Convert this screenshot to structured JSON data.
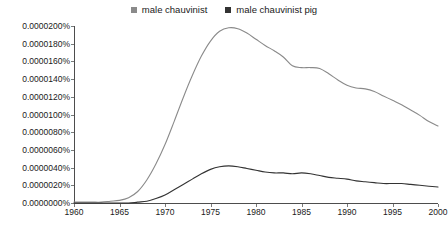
{
  "legend": {
    "position": "top-center",
    "entries": [
      {
        "label": "male chauvinist",
        "color": "#8a8a8a",
        "marker": "square"
      },
      {
        "label": "male chauvinist pig",
        "color": "#333333",
        "marker": "square"
      }
    ]
  },
  "axes": {
    "y_ticks": [
      "0.0000000%",
      "0.0000020%",
      "0.0000040%",
      "0.0000060%",
      "0.0000080%",
      "0.0000100%",
      "0.0000120%",
      "0.0000140%",
      "0.0000160%",
      "0.0000180%",
      "0.0000200%"
    ],
    "x_ticks": [
      "1960",
      "1965",
      "1970",
      "1975",
      "1980",
      "1985",
      "1990",
      "1995",
      "2000"
    ]
  },
  "chart_data": {
    "type": "line",
    "title": "",
    "subtitle": "",
    "xlabel": "",
    "ylabel": "",
    "xlim": [
      1960,
      2000
    ],
    "ylim": [
      0.0,
      2e-05
    ],
    "ytick_values": [
      0.0,
      2e-06,
      4e-06,
      6e-06,
      8e-06,
      1e-05,
      1.2e-05,
      1.4e-05,
      1.6e-05,
      1.8e-05,
      2e-05
    ],
    "ytick_labels": [
      "0.0000000%",
      "0.0000020%",
      "0.0000040%",
      "0.0000060%",
      "0.0000080%",
      "0.0000100%",
      "0.0000120%",
      "0.0000140%",
      "0.0000160%",
      "0.0000180%",
      "0.0000200%"
    ],
    "xtick_values": [
      1960,
      1965,
      1970,
      1975,
      1980,
      1985,
      1990,
      1995,
      2000
    ],
    "xtick_labels": [
      "1960",
      "1965",
      "1970",
      "1975",
      "1980",
      "1985",
      "1990",
      "1995",
      "2000"
    ],
    "grid": false,
    "legend_position": "top-center",
    "units": "percent of all bigrams/trigrams",
    "x": [
      1960,
      1961,
      1962,
      1963,
      1964,
      1965,
      1966,
      1967,
      1968,
      1969,
      1970,
      1971,
      1972,
      1973,
      1974,
      1975,
      1976,
      1977,
      1978,
      1979,
      1980,
      1981,
      1982,
      1983,
      1984,
      1985,
      1986,
      1987,
      1988,
      1989,
      1990,
      1991,
      1992,
      1993,
      1994,
      1995,
      1996,
      1997,
      1998,
      1999,
      2000
    ],
    "series": [
      {
        "name": "male chauvinist",
        "color": "#8a8a8a",
        "values": [
          1e-07,
          1e-07,
          1e-07,
          1e-07,
          2e-07,
          3e-07,
          6e-07,
          1.3e-06,
          2.6e-06,
          4.4e-06,
          6.6e-06,
          9.2e-06,
          1.19e-05,
          1.44e-05,
          1.66e-05,
          1.83e-05,
          1.94e-05,
          1.98e-05,
          1.97e-05,
          1.92e-05,
          1.85e-05,
          1.78e-05,
          1.72e-05,
          1.65e-05,
          1.55e-05,
          1.53e-05,
          1.53e-05,
          1.52e-05,
          1.46e-05,
          1.39e-05,
          1.33e-05,
          1.3e-05,
          1.29e-05,
          1.26e-05,
          1.21e-05,
          1.16e-05,
          1.11e-05,
          1.05e-05,
          9.9e-06,
          9.2e-06,
          8.7e-06
        ]
      },
      {
        "name": "male chauvinist pig",
        "color": "#333333",
        "values": [
          0.0,
          0.0,
          0.0,
          0.0,
          0.0,
          0.0,
          0.0,
          1e-07,
          2e-07,
          5e-07,
          9e-07,
          1.5e-06,
          2.1e-06,
          2.7e-06,
          3.3e-06,
          3.8e-06,
          4.1e-06,
          4.2e-06,
          4.1e-06,
          3.9e-06,
          3.7e-06,
          3.5e-06,
          3.4e-06,
          3.4e-06,
          3.3e-06,
          3.4e-06,
          3.3e-06,
          3.1e-06,
          2.9e-06,
          2.8e-06,
          2.7e-06,
          2.5e-06,
          2.4e-06,
          2.3e-06,
          2.2e-06,
          2.2e-06,
          2.2e-06,
          2.1e-06,
          2e-06,
          1.9e-06,
          1.8e-06
        ]
      }
    ]
  }
}
